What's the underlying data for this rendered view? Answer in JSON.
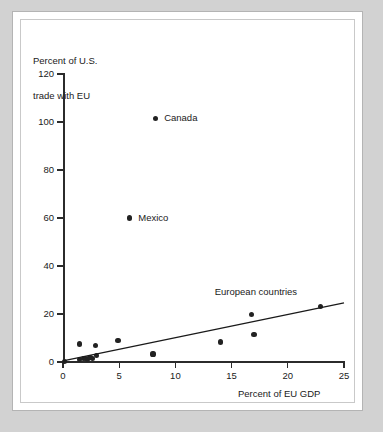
{
  "figure": {
    "background_color": "#d2d2d2",
    "panel_color": "#ffffff",
    "ink_color": "#1a1a1a"
  },
  "chart_data": {
    "type": "scatter",
    "title": "",
    "xlabel": "Percent of EU GDP",
    "ylabel": "Percent of U.S.\ntrade with EU",
    "ylabel_line1": "Percent of U.S.",
    "ylabel_line2": "trade with EU",
    "xlim": [
      0,
      25
    ],
    "ylim": [
      0,
      120
    ],
    "xticks": [
      0,
      5,
      10,
      15,
      20,
      25
    ],
    "yticks": [
      0,
      20,
      40,
      60,
      80,
      100,
      120
    ],
    "xtick_labels": [
      "0",
      "5",
      "10",
      "15",
      "20",
      "25"
    ],
    "ytick_labels": [
      "0",
      "20",
      "40",
      "60",
      "80",
      "100",
      "120"
    ],
    "grid": false,
    "legend": false,
    "marker_color": "#222222",
    "points": [
      {
        "x": 0.15,
        "y": 0.3,
        "label": ""
      },
      {
        "x": 1.5,
        "y": 7.5,
        "label": ""
      },
      {
        "x": 1.5,
        "y": 1.0,
        "label": ""
      },
      {
        "x": 1.8,
        "y": 1.3,
        "label": ""
      },
      {
        "x": 2.0,
        "y": 1.6,
        "label": ""
      },
      {
        "x": 2.2,
        "y": 1.2,
        "label": ""
      },
      {
        "x": 2.4,
        "y": 1.8,
        "label": ""
      },
      {
        "x": 2.6,
        "y": 1.4,
        "label": ""
      },
      {
        "x": 2.9,
        "y": 6.8,
        "label": ""
      },
      {
        "x": 3.0,
        "y": 2.8,
        "label": ""
      },
      {
        "x": 4.9,
        "y": 9.0,
        "label": ""
      },
      {
        "x": 5.9,
        "y": 60.0,
        "label": "Mexico"
      },
      {
        "x": 8.0,
        "y": 3.3,
        "label": ""
      },
      {
        "x": 8.2,
        "y": 101.5,
        "label": "Canada"
      },
      {
        "x": 14.0,
        "y": 8.3,
        "label": ""
      },
      {
        "x": 16.8,
        "y": 19.8,
        "label": ""
      },
      {
        "x": 17.0,
        "y": 11.4,
        "label": ""
      },
      {
        "x": 22.9,
        "y": 23.2,
        "label": ""
      }
    ],
    "trendline": {
      "x0": 0.0,
      "y0": 0.5,
      "x1": 25.0,
      "y1": 24.6,
      "color": "#1a1a1a",
      "width": 1.3
    },
    "annotations": [
      {
        "text": "European countries",
        "x": 13.5,
        "y": 29.0,
        "name": "european-countries-annotation"
      },
      {
        "text": "Canada",
        "x": 9.0,
        "y": 101.5,
        "name": "canada-point-label"
      },
      {
        "text": "Mexico",
        "x": 6.7,
        "y": 60.0,
        "name": "mexico-point-label"
      }
    ]
  }
}
